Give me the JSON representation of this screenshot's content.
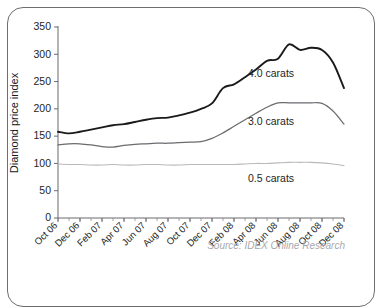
{
  "chart_data": {
    "type": "line",
    "title": "",
    "xlabel": "",
    "ylabel": "Diamond price index",
    "ylim": [
      0,
      350
    ],
    "yticks": [
      0,
      50,
      100,
      150,
      200,
      250,
      300,
      350
    ],
    "grid": false,
    "legend_position": "inline-annotations",
    "source": "Source: IDEX Online Research",
    "x": [
      "Oct 06",
      "Nov 06",
      "Dec 06",
      "Jan 07",
      "Feb 07",
      "Mar 07",
      "Apr 07",
      "May 07",
      "Jun 07",
      "Jul 07",
      "Aug 07",
      "Sep 07",
      "Oct 07",
      "Nov 07",
      "Dec 07",
      "Jan 08",
      "Feb 08",
      "Mar 08",
      "Apr 08",
      "May 08",
      "Jun 08",
      "Jul 08",
      "Aug 08",
      "Sep 08",
      "Oct 08",
      "Nov 08",
      "Dec 08"
    ],
    "xticklabels": [
      "Oct 06",
      "Dec 06",
      "Feb 07",
      "Apr 07",
      "Jun 07",
      "Aug 07",
      "Oct 07",
      "Dec 07",
      "Feb 08",
      "Apr 08",
      "Jun 08",
      "Aug 08",
      "Oct 08",
      "Dec 08"
    ],
    "series": [
      {
        "name": "4.0 carats",
        "color": "#1a1a1a",
        "values": [
          158,
          155,
          158,
          162,
          166,
          170,
          172,
          176,
          180,
          183,
          184,
          188,
          193,
          200,
          210,
          238,
          245,
          258,
          272,
          288,
          292,
          318,
          308,
          312,
          308,
          285,
          238
        ]
      },
      {
        "name": "3.0 carats",
        "color": "#6b6b70",
        "values": [
          134,
          136,
          136,
          134,
          131,
          130,
          133,
          135,
          136,
          137,
          137,
          138,
          139,
          140,
          146,
          156,
          168,
          180,
          192,
          203,
          211,
          211,
          211,
          211,
          210,
          196,
          172
        ]
      },
      {
        "name": "0.5 carats",
        "color": "#b9b9bd",
        "values": [
          99,
          98,
          98,
          97,
          97,
          98,
          97,
          97,
          98,
          98,
          97,
          97,
          98,
          98,
          98,
          98,
          98,
          99,
          100,
          100,
          101,
          102,
          102,
          102,
          101,
          99,
          96
        ]
      }
    ]
  },
  "annotations": {
    "series_labels": [
      {
        "text": "4.0 carats",
        "x": 248,
        "y": 77
      },
      {
        "text": "3.0 carats",
        "x": 248,
        "y": 125
      },
      {
        "text": "0.5 carats",
        "x": 248,
        "y": 182
      }
    ]
  }
}
